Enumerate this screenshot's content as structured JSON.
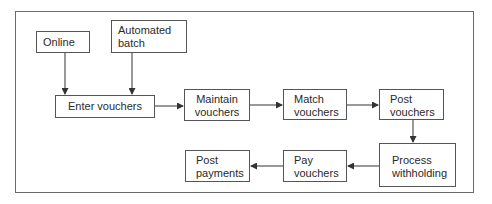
{
  "diagram": {
    "type": "flowchart",
    "nodes": {
      "online": {
        "label": "Online"
      },
      "automated_batch": {
        "label": "Automated\nbatch",
        "line1": "Automated",
        "line2": "batch"
      },
      "enter_vouchers": {
        "label": "Enter vouchers"
      },
      "maintain_vouchers": {
        "line1": "Maintain",
        "line2": "vouchers"
      },
      "match_vouchers": {
        "line1": "Match",
        "line2": "vouchers"
      },
      "post_vouchers": {
        "line1": "Post",
        "line2": "vouchers"
      },
      "process_withholding": {
        "line1": "Process",
        "line2": "withholding"
      },
      "pay_vouchers": {
        "line1": "Pay",
        "line2": "vouchers"
      },
      "post_payments": {
        "line1": "Post",
        "line2": "payments"
      }
    },
    "edges": [
      {
        "from": "Online",
        "to": "Enter vouchers"
      },
      {
        "from": "Automated batch",
        "to": "Enter vouchers"
      },
      {
        "from": "Enter vouchers",
        "to": "Maintain vouchers"
      },
      {
        "from": "Maintain vouchers",
        "to": "Match vouchers"
      },
      {
        "from": "Match vouchers",
        "to": "Post vouchers"
      },
      {
        "from": "Post vouchers",
        "to": "Process withholding"
      },
      {
        "from": "Process withholding",
        "to": "Pay vouchers"
      },
      {
        "from": "Pay vouchers",
        "to": "Post payments"
      }
    ],
    "colors": {
      "line": "#555555",
      "frame": "#6a6a6a",
      "text": "#2a2a2a",
      "background": "#ffffff"
    }
  }
}
